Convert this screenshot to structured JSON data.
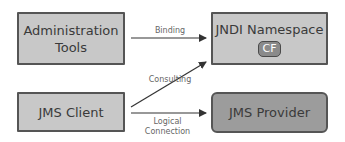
{
  "diagram": {
    "nodes": [
      {
        "id": "admin",
        "label_line1": "Administration",
        "label_line2": "Tools"
      },
      {
        "id": "jndi",
        "label": "JNDI Namespace",
        "badge": "CF"
      },
      {
        "id": "client",
        "label": "JMS Client"
      },
      {
        "id": "provider",
        "label": "JMS Provider"
      }
    ],
    "edges": [
      {
        "from": "admin",
        "to": "jndi",
        "label": "Binding"
      },
      {
        "from": "client",
        "to": "jndi",
        "label": "Consulting"
      },
      {
        "from": "client",
        "to": "provider",
        "label_line1": "Logical",
        "label_line2": "Connection"
      }
    ],
    "colors": {
      "box_fill": "#c8c8c8",
      "provider_fill": "#9c9c9c",
      "border": "#555555",
      "arrow": "#333333",
      "label_text": "#666666"
    }
  }
}
